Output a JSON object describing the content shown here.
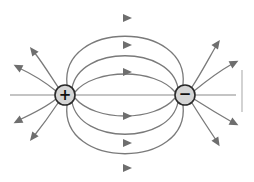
{
  "diagram": {
    "charges": [
      {
        "id": "positive",
        "sign": "+",
        "label": "positive-charge"
      },
      {
        "id": "negative",
        "sign": "−",
        "label": "negative-charge"
      }
    ],
    "connecting_field_lines_above": 3,
    "connecting_field_lines_below": 3,
    "outgoing_lines_positive": 4,
    "incoming_lines_negative": 4,
    "colors": {
      "line": "#7a7a7a",
      "charge_fill": "#d6d6d6",
      "charge_stroke": "#2a2a2a"
    }
  }
}
